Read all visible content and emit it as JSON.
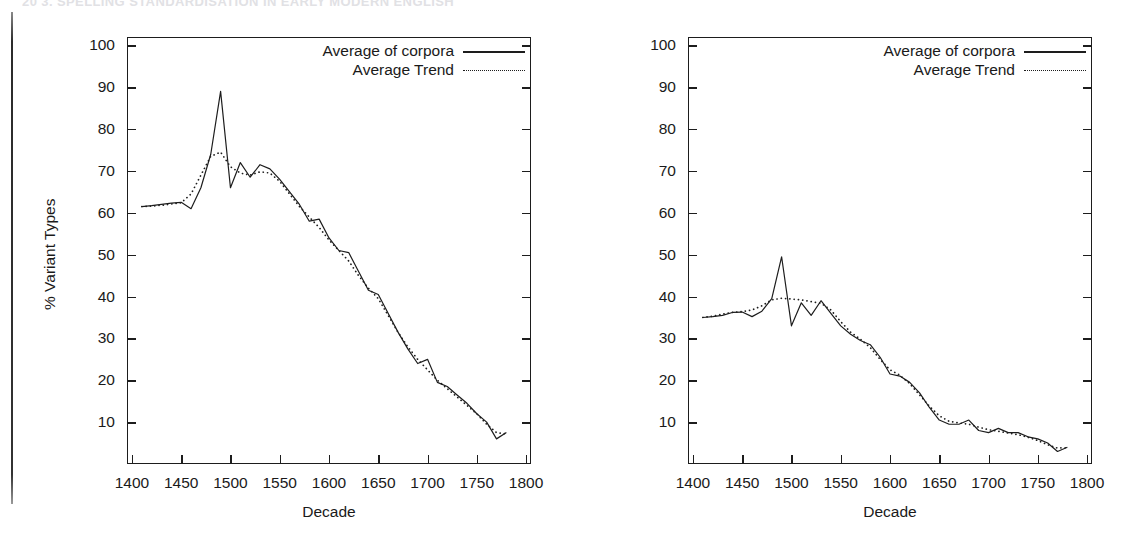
{
  "page": {
    "running_header": "20   3. SPELLING STANDARDISATION IN EARLY MODERN ENGLISH"
  },
  "charts": [
    {
      "id": "variant-types",
      "chart_data": {
        "type": "line",
        "title": "",
        "xlabel": "Decade",
        "ylabel": "% Variant Types",
        "xlim": [
          1395,
          1805
        ],
        "ylim": [
          0,
          102
        ],
        "xticks": [
          1400,
          1450,
          1500,
          1550,
          1600,
          1650,
          1700,
          1750,
          1800
        ],
        "yticks": [
          10,
          20,
          30,
          40,
          50,
          60,
          70,
          80,
          90,
          100
        ],
        "grid": false,
        "legend_position": "top-right",
        "legend": [
          "Average of corpora",
          "Average Trend"
        ],
        "series": [
          {
            "name": "Average of corpora",
            "style": "solid",
            "x": [
              1410,
              1420,
              1430,
              1440,
              1450,
              1460,
              1470,
              1480,
              1490,
              1500,
              1510,
              1520,
              1530,
              1540,
              1550,
              1560,
              1570,
              1580,
              1590,
              1600,
              1610,
              1620,
              1630,
              1640,
              1650,
              1660,
              1670,
              1680,
              1690,
              1700,
              1710,
              1720,
              1730,
              1740,
              1750,
              1760,
              1770,
              1780
            ],
            "values": [
              61.5,
              61.7,
              62.0,
              62.3,
              62.5,
              61.0,
              66.0,
              74.0,
              89.0,
              66.0,
              72.0,
              68.5,
              71.5,
              70.5,
              68.0,
              65.0,
              62.0,
              58.0,
              58.5,
              54.0,
              51.0,
              50.5,
              46.0,
              41.5,
              40.5,
              36.0,
              31.5,
              27.5,
              24.0,
              25.0,
              19.5,
              18.5,
              16.5,
              14.5,
              12.0,
              10.0,
              6.0,
              7.5
            ]
          },
          {
            "name": "Average Trend",
            "style": "dotted",
            "x": [
              1410,
              1420,
              1430,
              1440,
              1450,
              1460,
              1470,
              1480,
              1490,
              1500,
              1510,
              1520,
              1530,
              1540,
              1550,
              1560,
              1570,
              1580,
              1590,
              1600,
              1610,
              1620,
              1630,
              1640,
              1650,
              1660,
              1670,
              1680,
              1690,
              1700,
              1710,
              1720,
              1730,
              1740,
              1750,
              1760,
              1770,
              1780
            ],
            "values": [
              61.5,
              61.6,
              61.8,
              62.1,
              62.4,
              64.5,
              69.0,
              73.5,
              74.5,
              71.0,
              69.5,
              69.0,
              69.8,
              69.5,
              67.5,
              64.5,
              61.5,
              59.0,
              56.5,
              53.5,
              51.0,
              48.5,
              45.0,
              42.0,
              39.5,
              35.5,
              31.5,
              28.0,
              25.0,
              22.5,
              20.0,
              18.0,
              16.0,
              14.0,
              12.0,
              9.5,
              7.5,
              7.2
            ]
          }
        ]
      }
    },
    {
      "id": "variant-tokens",
      "chart_data": {
        "type": "line",
        "title": "",
        "xlabel": "Decade",
        "ylabel": "% Variant Tokens",
        "xlim": [
          1395,
          1805
        ],
        "ylim": [
          0,
          102
        ],
        "xticks": [
          1400,
          1450,
          1500,
          1550,
          1600,
          1650,
          1700,
          1750,
          1800
        ],
        "yticks": [
          10,
          20,
          30,
          40,
          50,
          60,
          70,
          80,
          90,
          100
        ],
        "grid": false,
        "legend_position": "top-right",
        "legend": [
          "Average of corpora",
          "Average Trend"
        ],
        "series": [
          {
            "name": "Average of corpora",
            "style": "solid",
            "x": [
              1410,
              1420,
              1430,
              1440,
              1450,
              1460,
              1470,
              1480,
              1490,
              1500,
              1510,
              1520,
              1530,
              1540,
              1550,
              1560,
              1570,
              1580,
              1590,
              1600,
              1610,
              1620,
              1630,
              1640,
              1650,
              1660,
              1670,
              1680,
              1690,
              1700,
              1710,
              1720,
              1730,
              1740,
              1750,
              1760,
              1770,
              1780
            ],
            "values": [
              35.0,
              35.2,
              35.5,
              36.2,
              36.3,
              35.2,
              36.5,
              39.5,
              49.5,
              33.0,
              38.5,
              35.5,
              39.0,
              36.0,
              33.0,
              31.0,
              29.5,
              28.5,
              25.5,
              21.5,
              21.0,
              19.5,
              17.0,
              13.5,
              10.5,
              9.5,
              9.5,
              10.5,
              8.0,
              7.5,
              8.5,
              7.5,
              7.5,
              6.5,
              6.0,
              5.0,
              3.0,
              4.0
            ]
          },
          {
            "name": "Average Trend",
            "style": "dotted",
            "x": [
              1410,
              1420,
              1430,
              1440,
              1450,
              1460,
              1470,
              1480,
              1490,
              1500,
              1510,
              1520,
              1530,
              1540,
              1550,
              1560,
              1570,
              1580,
              1590,
              1600,
              1610,
              1620,
              1630,
              1640,
              1650,
              1660,
              1670,
              1680,
              1690,
              1700,
              1710,
              1720,
              1730,
              1740,
              1750,
              1760,
              1770,
              1780
            ],
            "values": [
              35.0,
              35.3,
              35.8,
              36.2,
              36.4,
              36.8,
              37.8,
              39.2,
              39.6,
              39.4,
              39.2,
              38.8,
              38.4,
              36.8,
              34.0,
              31.5,
              29.8,
              27.8,
              25.0,
              22.5,
              21.2,
              19.2,
              16.5,
              13.8,
              11.5,
              10.2,
              9.8,
              9.5,
              8.8,
              8.2,
              7.8,
              7.4,
              7.0,
              6.4,
              5.6,
              4.6,
              3.8,
              3.9
            ]
          }
        ]
      }
    }
  ]
}
